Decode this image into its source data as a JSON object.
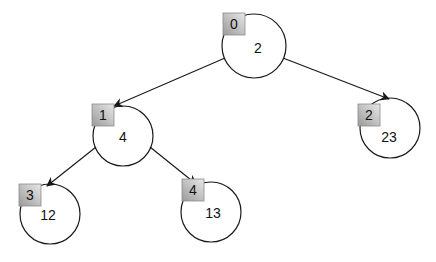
{
  "diagram": {
    "type": "binary-heap-tree",
    "nodes": [
      {
        "index": "0",
        "value": "2",
        "cx": 254,
        "cy": 46,
        "r": 32
      },
      {
        "index": "1",
        "value": "4",
        "cx": 123,
        "cy": 136,
        "r": 30
      },
      {
        "index": "2",
        "value": "23",
        "cx": 390,
        "cy": 128,
        "r": 30
      },
      {
        "index": "3",
        "value": "12",
        "cx": 50,
        "cy": 214,
        "r": 30
      },
      {
        "index": "4",
        "value": "13",
        "cx": 211,
        "cy": 212,
        "r": 30
      }
    ],
    "edges": [
      {
        "from": "0",
        "to": "1"
      },
      {
        "from": "0",
        "to": "2"
      },
      {
        "from": "1",
        "to": "3"
      },
      {
        "from": "1",
        "to": "4"
      }
    ],
    "colors": {
      "stroke": "#1a1a1a",
      "index_box_light": "#e6e6e6",
      "index_box_dark": "#9c9c9c"
    }
  }
}
